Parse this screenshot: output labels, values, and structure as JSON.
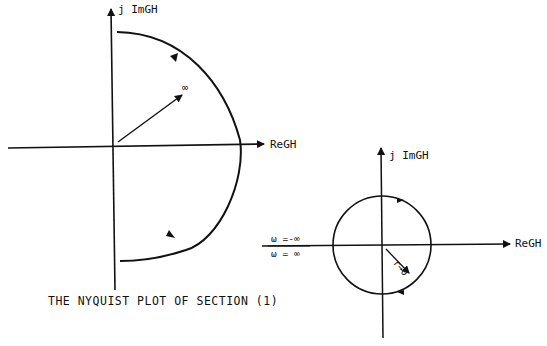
{
  "left_plot": {
    "y_axis_label": "j  ImGH",
    "x_axis_label": "ReGH",
    "radius_label": "∞",
    "caption": "THE NYQUIST PLOT OF SECTION (1)"
  },
  "right_plot": {
    "y_axis_label": "j  ImGH",
    "x_axis_label": "ReGH",
    "omega_neg_label": "ω =-∞",
    "omega_pos_label": "ω = ∞",
    "radius_label": "r→0"
  },
  "colors": {
    "ink": "#111111",
    "background": "#ffffff"
  }
}
